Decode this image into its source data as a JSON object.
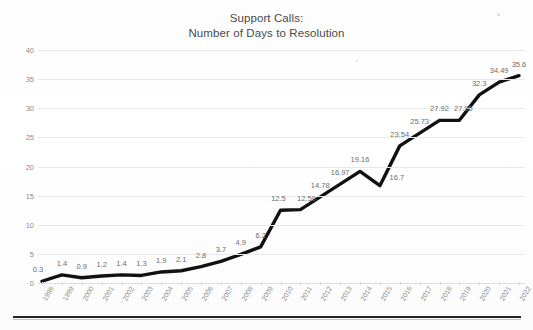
{
  "chart_data": {
    "type": "line",
    "title": "Support Calls:\nNumber of Days to Resolution",
    "title_line1": "Support Calls:",
    "title_line2": "Number of Days to Resolution",
    "xlabel": "",
    "ylabel": "",
    "ylim": [
      0,
      40
    ],
    "ytick_labels": [
      "0",
      "5",
      "10",
      "15",
      "20",
      "25",
      "30",
      "35",
      "40"
    ],
    "ytick_values": [
      0,
      5,
      10,
      15,
      20,
      25,
      30,
      35,
      40
    ],
    "grid": true,
    "legend": "none",
    "line_color": "#111111",
    "label_color": "#6d6d6d",
    "categories": [
      "1998",
      "1999",
      "2000",
      "2001",
      "2002",
      "2003",
      "2004",
      "2005",
      "2006",
      "2007",
      "2008",
      "2009",
      "2010",
      "2011",
      "2012",
      "2013",
      "2014",
      "2015",
      "2016",
      "2017",
      "2018",
      "2019",
      "2020",
      "2021",
      "2022"
    ],
    "values": [
      0.3,
      1.4,
      0.9,
      1.2,
      1.4,
      1.3,
      1.9,
      2.1,
      2.8,
      3.7,
      4.9,
      6.2,
      12.5,
      12.59,
      14.78,
      16.97,
      19.16,
      16.7,
      23.54,
      25.73,
      27.92,
      27.95,
      32.3,
      34.49,
      35.6
    ],
    "data_labels": [
      "0.3",
      "1.4",
      "0.9",
      "1.2",
      "1.4",
      "1.3",
      "1.9",
      "2.1",
      "2.8",
      "3.7",
      "4.9",
      "6.2",
      "12.5",
      "12.59",
      "14.78",
      "16.97",
      "19.16",
      "16.7",
      "23.54",
      "25.73",
      "27.92",
      "27.95",
      "32.3",
      "34.49",
      "35.6"
    ]
  }
}
